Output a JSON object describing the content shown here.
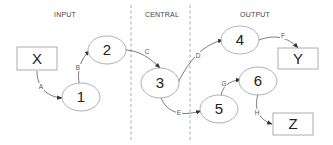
{
  "sections": [
    {
      "id": "input",
      "label": "INPUT"
    },
    {
      "id": "central",
      "label": "CENTRAL"
    },
    {
      "id": "output",
      "label": "OUTPUT"
    }
  ],
  "nodes": {
    "X": {
      "label": "X",
      "shape": "rectangle",
      "section": "input"
    },
    "n1": {
      "label": "1",
      "shape": "ellipse",
      "section": "input"
    },
    "n2": {
      "label": "2",
      "shape": "ellipse",
      "section": "input"
    },
    "n3": {
      "label": "3",
      "shape": "ellipse",
      "section": "central"
    },
    "n4": {
      "label": "4",
      "shape": "ellipse",
      "section": "output"
    },
    "n5": {
      "label": "5",
      "shape": "ellipse",
      "section": "output"
    },
    "n6": {
      "label": "6",
      "shape": "ellipse",
      "section": "output"
    },
    "Y": {
      "label": "Y",
      "shape": "rectangle",
      "section": "output"
    },
    "Z": {
      "label": "Z",
      "shape": "rectangle",
      "section": "output"
    }
  },
  "edges": {
    "A": {
      "label": "A",
      "from": "X",
      "to": "1"
    },
    "B": {
      "label": "B",
      "from": "1",
      "to": "2"
    },
    "C": {
      "label": "C",
      "from": "2",
      "to": "3"
    },
    "D": {
      "label": "D",
      "from": "3",
      "to": "4"
    },
    "E": {
      "label": "E",
      "from": "3",
      "to": "5"
    },
    "F": {
      "label": "F",
      "from": "4",
      "to": "Y"
    },
    "G": {
      "label": "G",
      "from": "5",
      "to": "6"
    },
    "H": {
      "label": "H",
      "from": "6",
      "to": "Z"
    }
  }
}
